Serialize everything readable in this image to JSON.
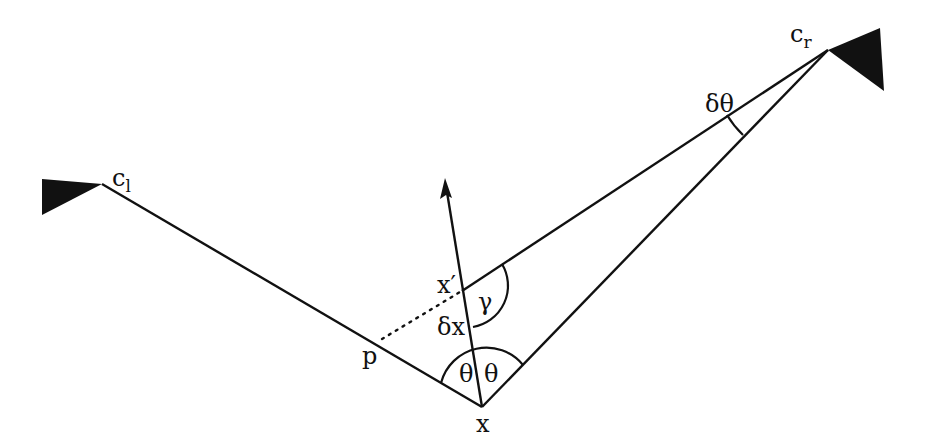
{
  "diagram": {
    "type": "geometry",
    "colors": {
      "ink": "#111111",
      "background": "#ffffff"
    },
    "labels": {
      "camera_left": "c",
      "camera_left_sub": "l",
      "camera_right": "c",
      "camera_right_sub": "r",
      "point_x": "x",
      "point_x_prime": "x′",
      "point_p": "p",
      "delta_x": "δx",
      "gamma": "γ",
      "theta_left": "θ",
      "theta_right": "θ",
      "delta_theta": "δθ"
    },
    "points": {
      "c_l": [
        102,
        184
      ],
      "c_r": [
        828,
        50
      ],
      "x": [
        482,
        407
      ],
      "x_prime": [
        462,
        291
      ],
      "p": [
        380,
        340
      ],
      "normal_arrow_tip": [
        445,
        178
      ]
    },
    "segments": [
      {
        "from": "c_l",
        "to": "x",
        "style": "solid"
      },
      {
        "from": "x",
        "to": "c_r",
        "style": "solid"
      },
      {
        "from": "x_prime",
        "to": "c_r",
        "style": "solid"
      },
      {
        "from": "x",
        "to": "normal_arrow_tip",
        "style": "arrow"
      },
      {
        "from": "p",
        "to": "x_prime",
        "style": "dotted"
      }
    ],
    "angles": [
      "θ (left, at x)",
      "θ (right, at x)",
      "γ (at x′)",
      "δθ (at c_r)"
    ]
  }
}
